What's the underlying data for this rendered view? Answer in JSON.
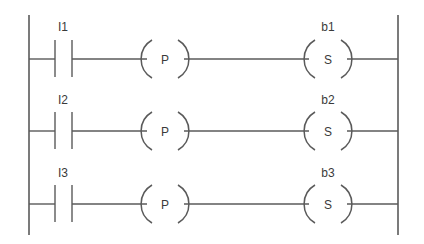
{
  "diagram": {
    "type": "ladder-logic",
    "colors": {
      "line": "#5a5a5a",
      "text": "#3a3a3a",
      "background": "#ffffff"
    },
    "rails": {
      "left_x": 29,
      "right_x": 398,
      "top_y": 15,
      "bottom_y": 235
    },
    "rungs": [
      {
        "y": 59,
        "contact": {
          "label": "I1",
          "type": "normally-open"
        },
        "pulse_coil": {
          "letter": "P"
        },
        "output_coil": {
          "label": "b1",
          "letter": "S",
          "type": "set"
        }
      },
      {
        "y": 131,
        "contact": {
          "label": "I2",
          "type": "normally-open"
        },
        "pulse_coil": {
          "letter": "P"
        },
        "output_coil": {
          "label": "b2",
          "letter": "S",
          "type": "set"
        }
      },
      {
        "y": 204,
        "contact": {
          "label": "I3",
          "type": "normally-open"
        },
        "pulse_coil": {
          "letter": "P"
        },
        "output_coil": {
          "label": "b3",
          "letter": "S",
          "type": "set"
        }
      }
    ]
  }
}
